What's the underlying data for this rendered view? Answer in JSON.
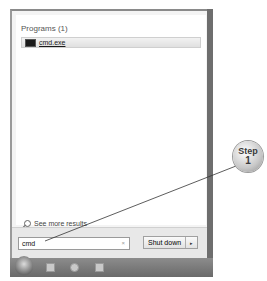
{
  "start_menu": {
    "results_group": "Programs (1)",
    "results": [
      {
        "label": "cmd.exe",
        "icon": "console-icon"
      }
    ],
    "see_more": "See more results",
    "search": {
      "value": "cmd",
      "clear_symbol": "×"
    },
    "shutdown": {
      "label": "Shut down",
      "arrow": "▸"
    }
  },
  "taskbar": {
    "items": [
      "start-orb",
      "media-player-icon",
      "internet-explorer-icon",
      "file-explorer-icon"
    ]
  },
  "callout": {
    "word": "Step",
    "number": "1"
  }
}
